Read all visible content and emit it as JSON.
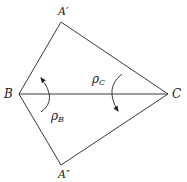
{
  "diagram": {
    "points": {
      "A_prime": {
        "label": "A′",
        "x": 61,
        "y": 22
      },
      "B": {
        "label": "B",
        "x": 19,
        "y": 94
      },
      "C": {
        "label": "C",
        "x": 168,
        "y": 94
      },
      "A_double_prime": {
        "label": "A″",
        "x": 61,
        "y": 165
      }
    },
    "labels": {
      "rho_b": {
        "base": "ρ",
        "sub": "B"
      },
      "rho_c": {
        "base": "ρ",
        "sub": "C"
      }
    },
    "colors": {
      "stroke": "#3a3a3a",
      "text": "#222222",
      "background": "#ffffff"
    }
  }
}
